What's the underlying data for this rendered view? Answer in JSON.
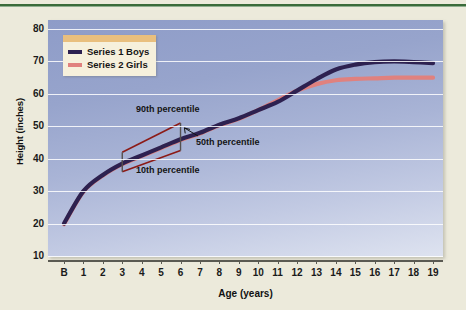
{
  "chart_data": {
    "type": "line",
    "title": "",
    "xlabel": "Age (years)",
    "ylabel": "Height (inches)",
    "xlim": [
      0,
      20
    ],
    "ylim": [
      0,
      80
    ],
    "yticks": [
      80,
      70,
      60,
      50,
      40,
      30,
      20,
      10
    ],
    "xticks": [
      "B",
      "1",
      "2",
      "3",
      "4",
      "5",
      "6",
      "7",
      "8",
      "9",
      "10",
      "11",
      "12",
      "13",
      "14",
      "15",
      "16",
      "17",
      "18",
      "19"
    ],
    "grid": true,
    "legend_position": "top-left",
    "x": [
      0,
      1,
      2,
      3,
      4,
      5,
      6,
      7,
      8,
      9,
      10,
      11,
      12,
      13,
      14,
      15,
      16,
      17,
      18,
      19
    ],
    "series": [
      {
        "name": "Series 1 Boys",
        "color": "#2d2150",
        "values": [
          20,
          30,
          35,
          38.5,
          41,
          43.5,
          46,
          48,
          50.5,
          52.5,
          55,
          57.5,
          61,
          64.5,
          67.5,
          69,
          69.8,
          70,
          69.8,
          69.5
        ]
      },
      {
        "name": "Series 2 Girls",
        "color": "#e0817e",
        "values": [
          19.8,
          29.8,
          34.8,
          38.3,
          40.8,
          43.3,
          45.8,
          47.8,
          50.3,
          52.3,
          55,
          58,
          61,
          63,
          64.2,
          64.6,
          64.8,
          65,
          65,
          65
        ]
      }
    ],
    "annotations": [
      {
        "label": "90th percentile",
        "color": "#8c1a16",
        "x_start": 3,
        "y_start": 42,
        "x_end": 6,
        "y_end": 51
      },
      {
        "label": "50th percentile",
        "color": "#141414",
        "x_start": 6.9,
        "y_start": 47,
        "x_end": 6.2,
        "y_end": 49.5
      },
      {
        "label": "10th percentile",
        "color": "#8c1a16",
        "x_start": 3,
        "y_start": 36,
        "x_end": 6,
        "y_end": 42.5
      }
    ],
    "error_bar_caps": [
      {
        "x": 3,
        "y_low": 36,
        "y_high": 42
      },
      {
        "x": 6,
        "y_low": 42.5,
        "y_high": 51
      }
    ]
  },
  "legend": {
    "items": [
      {
        "label": "Series 1 Boys",
        "color": "#2d2150"
      },
      {
        "label": "Series 2 Girls",
        "color": "#e0817e"
      }
    ]
  },
  "axes": {
    "y_title": "Height (inches)",
    "x_title": "Age (years)"
  },
  "annotation_labels": {
    "p90": "90th percentile",
    "p50": "50th percentile",
    "p10": "10th percentile"
  }
}
